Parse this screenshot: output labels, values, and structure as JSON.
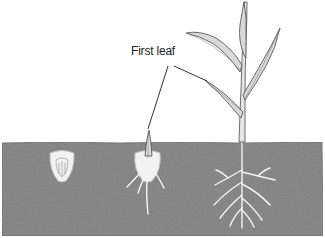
{
  "figure": {
    "annotation": "First leaf",
    "stages": [
      {
        "name": "seed-kernel"
      },
      {
        "name": "germinating-seedling"
      },
      {
        "name": "young-plant"
      }
    ],
    "colors": {
      "soil": "#8c8c8c",
      "soil_dark": "#6e6e6e",
      "kernel": "#f2f2f2",
      "root": "#f4f4f4",
      "leaf_fill": "#d9d9d9",
      "stroke": "#4a4a4a",
      "leader_line": "#333333"
    }
  }
}
